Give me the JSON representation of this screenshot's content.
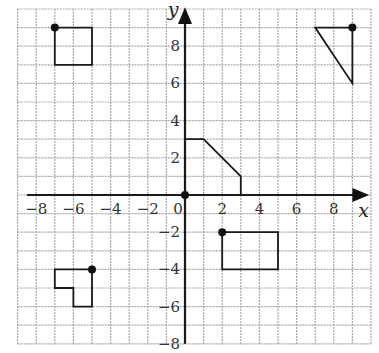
{
  "diagram": {
    "type": "coordinate-grid",
    "x_axis": {
      "label": "x",
      "min": -9,
      "max": 10,
      "ticks": [
        -8,
        -6,
        -4,
        -2,
        0,
        2,
        4,
        6,
        8
      ]
    },
    "y_axis": {
      "label": "y",
      "min": -8,
      "max": 10,
      "ticks": [
        8,
        6,
        4,
        2,
        -2,
        -4,
        -6,
        -8
      ]
    },
    "origin_label": "0",
    "shapes": [
      {
        "name": "square",
        "points": [
          [
            -7,
            9
          ],
          [
            -5,
            9
          ],
          [
            -5,
            7
          ],
          [
            -7,
            7
          ]
        ],
        "marked_vertex": [
          -7,
          9
        ]
      },
      {
        "name": "triangle",
        "points": [
          [
            7,
            9
          ],
          [
            9,
            9
          ],
          [
            9,
            6
          ]
        ],
        "marked_vertex": [
          9,
          9
        ]
      },
      {
        "name": "pentagon",
        "points": [
          [
            0,
            3
          ],
          [
            1,
            3
          ],
          [
            3,
            1
          ],
          [
            3,
            0
          ],
          [
            0,
            0
          ]
        ],
        "marked_vertex": [
          0,
          0
        ]
      },
      {
        "name": "rectangle",
        "points": [
          [
            2,
            -2
          ],
          [
            5,
            -2
          ],
          [
            5,
            -4
          ],
          [
            2,
            -4
          ]
        ],
        "marked_vertex": [
          2,
          -2
        ]
      },
      {
        "name": "l-shape",
        "points": [
          [
            -7,
            -4
          ],
          [
            -5,
            -4
          ],
          [
            -5,
            -6
          ],
          [
            -6,
            -6
          ],
          [
            -6,
            -5
          ],
          [
            -7,
            -5
          ]
        ],
        "marked_vertex": [
          -5,
          -4
        ]
      }
    ],
    "colors": {
      "grid": "#a8a8a8",
      "axis": "#1a1a1a",
      "shape": "#1a1a1a",
      "background": "#ffffff"
    }
  }
}
